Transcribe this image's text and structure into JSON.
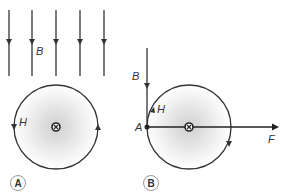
{
  "panels": [
    {
      "id": "A",
      "label": "A",
      "field_label": "B",
      "circle_label": "H"
    },
    {
      "id": "B",
      "label": "B",
      "field_label": "B",
      "circle_label": "H",
      "point_label": "A",
      "force_label": "F"
    }
  ],
  "colors": {
    "line": "#333333",
    "shade": "#d8d8d8"
  }
}
